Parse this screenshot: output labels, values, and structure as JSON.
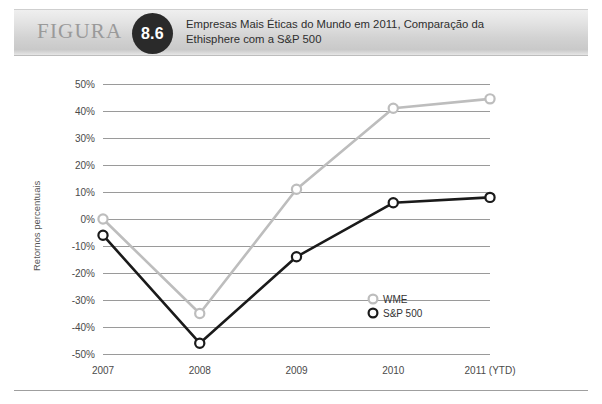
{
  "header": {
    "figura_label": "FIGURA",
    "figure_number": "8.6",
    "title_line1": "Empresas Mais Éticas do Mundo em 2011, Comparação da",
    "title_line2": "Ethisphere com a S&P 500",
    "badge_color": "#2a2a2a"
  },
  "chart_data": {
    "type": "line",
    "title": "Empresas Mais Éticas do Mundo em 2011, Comparação da Ethisphere com a S&P 500",
    "xlabel": "",
    "ylabel": "Retornos percentuais",
    "categories": [
      "2007",
      "2008",
      "2009",
      "2010",
      "2011 (YTD)"
    ],
    "series": [
      {
        "name": "WME",
        "color": "#bdbdbd",
        "values": [
          0,
          -35,
          11,
          41,
          44.5
        ]
      },
      {
        "name": "S&P 500",
        "color": "#1a1a1a",
        "values": [
          -6,
          -46,
          -14,
          6,
          8
        ]
      }
    ],
    "ylim": [
      -50,
      50
    ],
    "ytick_step": 10,
    "ytick_labels": [
      "50%",
      "40%",
      "30%",
      "20%",
      "10%",
      "0%",
      "-10%",
      "-20%",
      "-30%",
      "-40%",
      "-50%"
    ],
    "ytick_values": [
      50,
      40,
      30,
      20,
      10,
      0,
      -10,
      -20,
      -30,
      -40,
      -50
    ],
    "grid": true,
    "grid_color": "#9a9a9a",
    "legend_position": "bottom-right",
    "marker": "open-circle"
  }
}
